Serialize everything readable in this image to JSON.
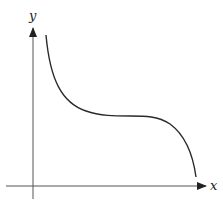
{
  "figure": {
    "type": "function-graph",
    "axes": {
      "x_label": "x",
      "y_label": "y"
    },
    "curve": {
      "description": "Decreasing curve with a horizontal inflection plateau (cubic-like, e.g. y = -x^3 shape shifted)",
      "color": "#2a2a2a"
    },
    "colors": {
      "axis": "#333333",
      "background": "#ffffff"
    }
  }
}
